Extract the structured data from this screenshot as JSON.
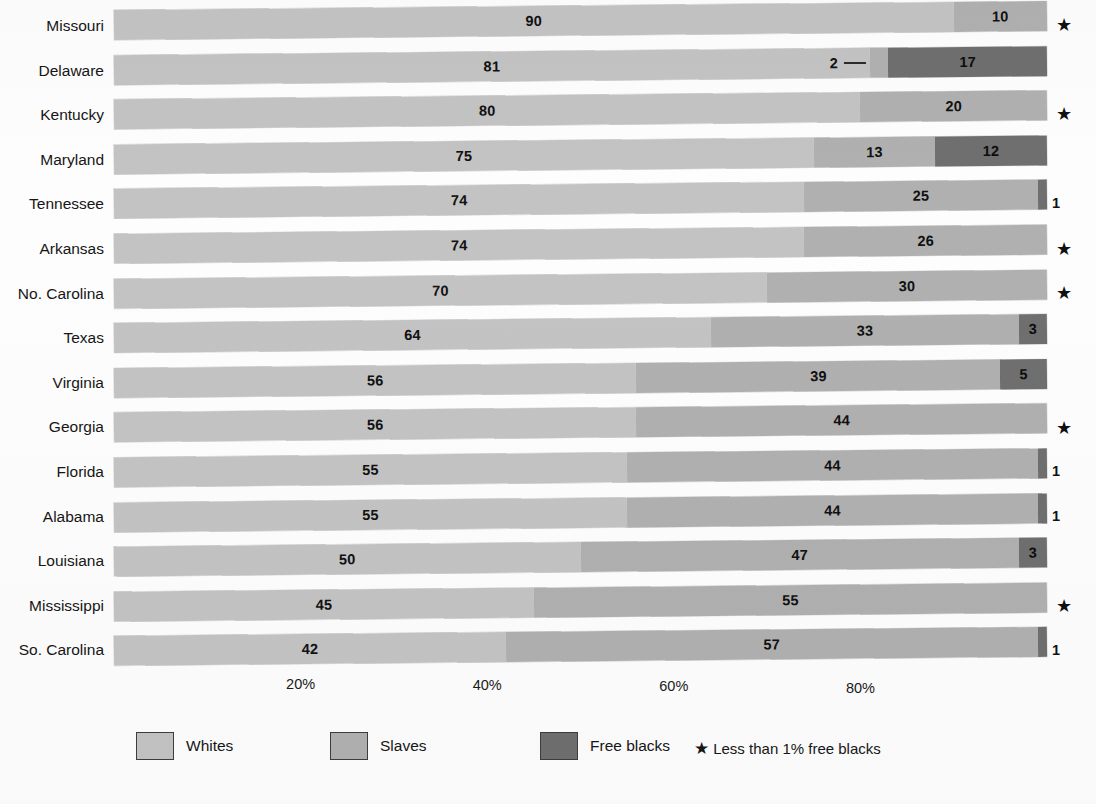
{
  "chart": {
    "type": "bar",
    "title": "",
    "subtitle": "",
    "xlabel": "",
    "ylabel": ""
  },
  "axis": {
    "ticks": [
      "20%",
      "40%",
      "60%",
      "80%"
    ],
    "tick_values": [
      20,
      40,
      60,
      80
    ],
    "range": [
      0,
      100
    ],
    "grid": "off"
  },
  "legend": {
    "position": "bottom",
    "items": [
      {
        "label": "Whites",
        "color": "#c3c3c3"
      },
      {
        "label": "Slaves",
        "color": "#b0b0b0"
      },
      {
        "label": "Free blacks",
        "color": "#6f6f6f"
      }
    ],
    "note_star": "★",
    "note": "Less than 1% free blacks"
  },
  "chart_data": {
    "type": "bar",
    "orientation": "horizontal",
    "stacked": true,
    "normalized_percent": true,
    "title": "",
    "xlabel": "",
    "ylabel": "",
    "xlim": [
      0,
      100
    ],
    "grid": false,
    "legend_position": "bottom",
    "categories": [
      "Missouri",
      "Delaware",
      "Kentucky",
      "Maryland",
      "Tennessee",
      "Arkansas",
      "No. Carolina",
      "Texas",
      "Virginia",
      "Georgia",
      "Florida",
      "Alabama",
      "Louisiana",
      "Mississippi",
      "So. Carolina"
    ],
    "series": [
      {
        "name": "Whites",
        "color": "#c3c3c3",
        "values": [
          90,
          81,
          80,
          75,
          74,
          74,
          70,
          64,
          56,
          56,
          55,
          55,
          50,
          45,
          42
        ]
      },
      {
        "name": "Slaves",
        "color": "#b0b0b0",
        "values": [
          10,
          2,
          20,
          13,
          25,
          26,
          30,
          33,
          39,
          44,
          44,
          44,
          47,
          55,
          57
        ]
      },
      {
        "name": "Free blacks",
        "color": "#6f6f6f",
        "values": [
          0,
          17,
          0,
          12,
          1,
          0,
          0,
          3,
          5,
          0,
          1,
          1,
          3,
          0,
          1
        ]
      }
    ],
    "annotations": [
      {
        "category": "Missouri",
        "marker": "*",
        "meaning": "Less than 1% free blacks"
      },
      {
        "category": "Kentucky",
        "marker": "*",
        "meaning": "Less than 1% free blacks"
      },
      {
        "category": "Arkansas",
        "marker": "*",
        "meaning": "Less than 1% free blacks"
      },
      {
        "category": "No. Carolina",
        "marker": "*",
        "meaning": "Less than 1% free blacks"
      },
      {
        "category": "Georgia",
        "marker": "*",
        "meaning": "Less than 1% free blacks"
      },
      {
        "category": "Mississippi",
        "marker": "*",
        "meaning": "Less than 1% free blacks"
      },
      {
        "category": "Delaware",
        "marker": "callout",
        "meaning": "Slaves segment labelled 2 with leader line"
      }
    ]
  },
  "rows": [
    {
      "state": "Missouri",
      "whites": 90,
      "slaves": 10,
      "free": 0,
      "whites_label": "90",
      "slaves_label": "10",
      "free_label": "",
      "star": "★",
      "outside_label": "",
      "callout": false
    },
    {
      "state": "Delaware",
      "whites": 81,
      "slaves": 2,
      "free": 17,
      "whites_label": "81",
      "slaves_label": "2",
      "free_label": "17",
      "star": "",
      "outside_label": "",
      "callout": true
    },
    {
      "state": "Kentucky",
      "whites": 80,
      "slaves": 20,
      "free": 0,
      "whites_label": "80",
      "slaves_label": "20",
      "free_label": "",
      "star": "★",
      "outside_label": "",
      "callout": false
    },
    {
      "state": "Maryland",
      "whites": 75,
      "slaves": 13,
      "free": 12,
      "whites_label": "75",
      "slaves_label": "13",
      "free_label": "12",
      "star": "",
      "outside_label": "",
      "callout": false
    },
    {
      "state": "Tennessee",
      "whites": 74,
      "slaves": 25,
      "free": 1,
      "whites_label": "74",
      "slaves_label": "25",
      "free_label": "",
      "star": "",
      "outside_label": "1",
      "callout": false
    },
    {
      "state": "Arkansas",
      "whites": 74,
      "slaves": 26,
      "free": 0,
      "whites_label": "74",
      "slaves_label": "26",
      "free_label": "",
      "star": "★",
      "outside_label": "",
      "callout": false
    },
    {
      "state": "No. Carolina",
      "whites": 70,
      "slaves": 30,
      "free": 0,
      "whites_label": "70",
      "slaves_label": "30",
      "free_label": "",
      "star": "★",
      "outside_label": "",
      "callout": false
    },
    {
      "state": "Texas",
      "whites": 64,
      "slaves": 33,
      "free": 3,
      "whites_label": "64",
      "slaves_label": "33",
      "free_label": "3",
      "star": "",
      "outside_label": "",
      "callout": false
    },
    {
      "state": "Virginia",
      "whites": 56,
      "slaves": 39,
      "free": 5,
      "whites_label": "56",
      "slaves_label": "39",
      "free_label": "5",
      "star": "",
      "outside_label": "",
      "callout": false
    },
    {
      "state": "Georgia",
      "whites": 56,
      "slaves": 44,
      "free": 0,
      "whites_label": "56",
      "slaves_label": "44",
      "free_label": "",
      "star": "★",
      "outside_label": "",
      "callout": false
    },
    {
      "state": "Florida",
      "whites": 55,
      "slaves": 44,
      "free": 1,
      "whites_label": "55",
      "slaves_label": "44",
      "free_label": "",
      "star": "",
      "outside_label": "1",
      "callout": false
    },
    {
      "state": "Alabama",
      "whites": 55,
      "slaves": 44,
      "free": 1,
      "whites_label": "55",
      "slaves_label": "44",
      "free_label": "",
      "star": "",
      "outside_label": "1",
      "callout": false
    },
    {
      "state": "Louisiana",
      "whites": 50,
      "slaves": 47,
      "free": 3,
      "whites_label": "50",
      "slaves_label": "47",
      "free_label": "3",
      "star": "",
      "outside_label": "",
      "callout": false
    },
    {
      "state": "Mississippi",
      "whites": 45,
      "slaves": 55,
      "free": 0,
      "whites_label": "45",
      "slaves_label": "55",
      "free_label": "",
      "star": "★",
      "outside_label": "",
      "callout": false
    },
    {
      "state": "So. Carolina",
      "whites": 42,
      "slaves": 57,
      "free": 1,
      "whites_label": "42",
      "slaves_label": "57",
      "free_label": "",
      "star": "",
      "outside_label": "1",
      "callout": false
    }
  ]
}
